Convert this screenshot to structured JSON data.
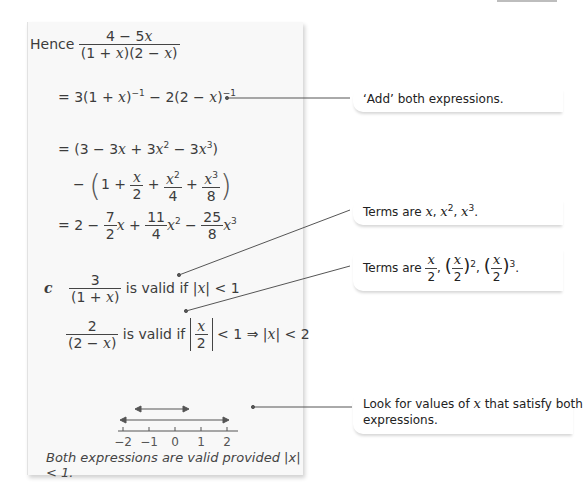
{
  "worked_solution": {
    "hence_label": "Hence",
    "frac_num": "4 − 5x",
    "frac_den": "(1 + x)(2 − x)",
    "line1": "= 3(1 + x)⁻¹ − 2(2 − x)⁻¹",
    "line2": "= (3 − 3x + 3x² − 3x³)",
    "line3": "− (1 + x/2 + x²/4 + x³/8)",
    "line4": "= 2 − 7/2 x + 11/4 x² − 25/8 x³",
    "part_label": "c",
    "valid1_num": "3",
    "valid1_den": "(1 + x)",
    "valid1_text": "is valid if",
    "valid1_cond": "|x| < 1",
    "valid2_num": "2",
    "valid2_den": "(2 − x)",
    "valid2_text": "is valid if",
    "valid2_cond": "< 1 ⇒ |x| < 2",
    "number_line": {
      "ticks": [
        "−2",
        "−1",
        "0",
        "1",
        "2"
      ],
      "arrow_inner": [
        -1,
        1
      ],
      "arrow_outer": [
        -2,
        2
      ]
    },
    "conclusion": "Both expressions are valid provided |x| < 1."
  },
  "notes": [
    {
      "text": "‘Add’ both expressions."
    },
    {
      "text": "Terms are x, x², x³."
    },
    {
      "text": "Terms are x/2, (x/2)², (x/2)³."
    },
    {
      "line1": "Look for values of x that satisfy both",
      "line2": "expressions."
    }
  ]
}
